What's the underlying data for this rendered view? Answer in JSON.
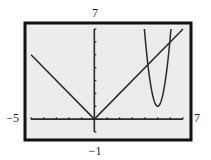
{
  "chart_data": {
    "type": "line",
    "title": "",
    "xlabel": "",
    "ylabel": "",
    "xlim": [
      -5,
      7
    ],
    "ylim": [
      -1,
      7
    ],
    "xticks_step": 1,
    "yticks_step": 1,
    "grid": false,
    "window_labels": {
      "xmin": "−5",
      "xmax": "7",
      "ymin": "−1",
      "ymax": "7"
    },
    "series": [
      {
        "name": "y = |x|",
        "points": [
          [
            -5,
            5
          ],
          [
            0,
            0
          ],
          [
            7,
            7
          ]
        ]
      },
      {
        "name": "parabola",
        "vertex": [
          5,
          1
        ],
        "points": [
          [
            3.95,
            7
          ],
          [
            4.3,
            3.9
          ],
          [
            4.6,
            2.0
          ],
          [
            5,
            1
          ],
          [
            5.4,
            2.0
          ],
          [
            5.7,
            3.9
          ],
          [
            6.0,
            7
          ]
        ]
      }
    ],
    "colors": {
      "screen_bg": "#ececec",
      "frame": "#111111",
      "ink": "#2a2a2a"
    }
  }
}
